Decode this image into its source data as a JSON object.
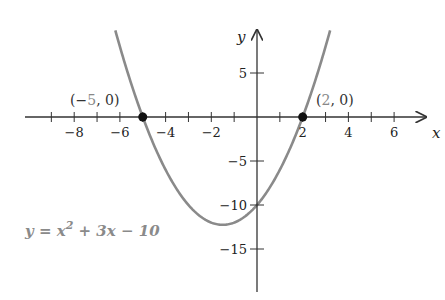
{
  "chart_data": {
    "type": "line",
    "title": "",
    "equation": "y = x^2 + 3x - 10",
    "equation_parts": {
      "lhs": "y",
      "eq": " = ",
      "x": "x",
      "exp": "2",
      "rest": " + 3x − 10"
    },
    "xlabel": "x",
    "ylabel": "y",
    "xlim": [
      -9.6,
      7.4
    ],
    "ylim": [
      -19.6,
      10
    ],
    "x_ticks": [
      -9,
      -8,
      -7,
      -6,
      -5,
      -4,
      -3,
      -2,
      -1,
      1,
      2,
      3,
      4,
      5,
      6
    ],
    "x_tick_labels": [
      {
        "value": -8,
        "label": "−8"
      },
      {
        "value": -6,
        "label": "−6"
      },
      {
        "value": -4,
        "label": "−4"
      },
      {
        "value": -2,
        "label": "−2"
      },
      {
        "value": 2,
        "label": "2"
      },
      {
        "value": 4,
        "label": "4"
      },
      {
        "value": 6,
        "label": "6"
      }
    ],
    "y_ticks": [
      {
        "value": 5,
        "label": "5"
      },
      {
        "value": -5,
        "label": "−5"
      },
      {
        "value": -10,
        "label": "−10"
      },
      {
        "value": -15,
        "label": "−15"
      }
    ],
    "grid": false,
    "legend": null,
    "series": [
      {
        "name": "y = x^2 + 3x - 10",
        "color": "#8a8a8a",
        "coefficients": {
          "a": 1,
          "b": 3,
          "c": -10
        },
        "x_range": [
          -6.2,
          3.2
        ],
        "x": [
          -6,
          -5,
          -4,
          -3,
          -2,
          -1.5,
          -1,
          0,
          1,
          2,
          3
        ],
        "y": [
          8,
          0,
          -6,
          -10,
          -12,
          -12.25,
          -12,
          -10,
          -6,
          0,
          8
        ]
      }
    ],
    "annotations": [
      {
        "type": "point",
        "x": -5,
        "y": 0,
        "label_prefix": "(−",
        "label_num": "5",
        "label_suffix": ", 0)"
      },
      {
        "type": "point",
        "x": 2,
        "y": 0,
        "label_prefix": "(",
        "label_num": "2",
        "label_suffix": ", 0)"
      }
    ],
    "colors": {
      "axis": "#333333",
      "curve": "#8a8a8a",
      "point": "#111111",
      "equation": "#8a8a8a"
    }
  }
}
